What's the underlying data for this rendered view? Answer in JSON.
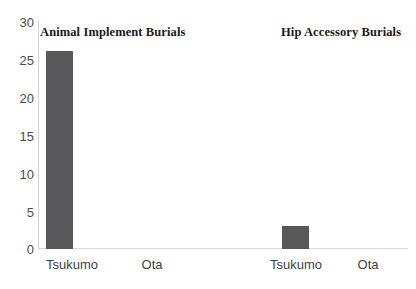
{
  "chart_data": {
    "type": "bar",
    "title": "",
    "subtitle": "",
    "xlabel": "",
    "ylabel": "",
    "ylim": [
      0,
      30
    ],
    "yticks": [
      0,
      5,
      10,
      15,
      20,
      25,
      30
    ],
    "ytick_labels": [
      "0",
      "5",
      "10",
      "15",
      "20",
      "25",
      "30"
    ],
    "grid": false,
    "legend": false,
    "categories": [
      "Tsukumo",
      "Ota",
      "Tsukumo",
      "Ota"
    ],
    "values": [
      26,
      0,
      3,
      0
    ],
    "groups": [
      {
        "label": "Animal Implement Burials",
        "categories": [
          "Tsukumo",
          "Ota"
        ],
        "values": [
          26,
          0
        ]
      },
      {
        "label": "Hip Accessory Burials",
        "categories": [
          "Tsukumo",
          "Ota"
        ],
        "values": [
          3,
          0
        ]
      }
    ],
    "bar_color": "#58585a",
    "axis_color": "#d3d3d3",
    "background": "#ffffff"
  },
  "axis": {
    "y": {
      "t0": "0",
      "t1": "5",
      "t2": "10",
      "t3": "15",
      "t4": "20",
      "t5": "25",
      "t6": "30"
    }
  },
  "groups": {
    "g0_title": "Animal Implement Burials",
    "g1_title": "Hip Accessory Burials"
  },
  "categories": {
    "c0": "Tsukumo",
    "c1": "Ota",
    "c2": "Tsukumo",
    "c3": "Ota"
  }
}
